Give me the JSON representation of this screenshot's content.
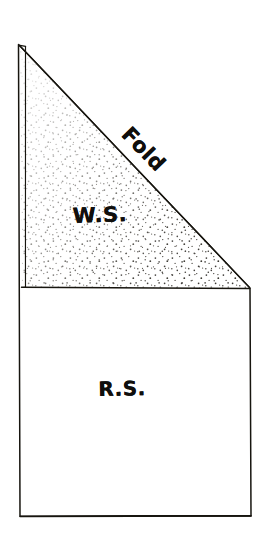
{
  "diagram": {
    "type": "line-drawing",
    "canvas": {
      "width": 267,
      "height": 540
    },
    "background_color": "#ffffff",
    "ink_color": "#100f0d",
    "labels": {
      "wrong_side": "W.S.",
      "right_side": "R.S.",
      "fold": "Fold"
    },
    "regions": [
      {
        "name": "upper-triangle",
        "label": "W.S.",
        "fill": "stipple",
        "description": "stippled triangular area above the horizontal divider"
      },
      {
        "name": "lower-rectangle",
        "label": "R.S.",
        "fill": "blank",
        "description": "plain rectangular area below the horizontal divider"
      }
    ],
    "edges": {
      "fold_edge": "Fold",
      "fold_edge_note": "diagonal hypotenuse from apex to right edge",
      "left_edge_note": "doubled line indicating folded edge"
    },
    "geometry": {
      "apex": [
        18,
        44
      ],
      "diagonal_end": [
        250,
        288
      ],
      "right_bottom": [
        251,
        516
      ],
      "left_bottom": [
        20,
        516
      ],
      "divider_y": 288
    }
  }
}
